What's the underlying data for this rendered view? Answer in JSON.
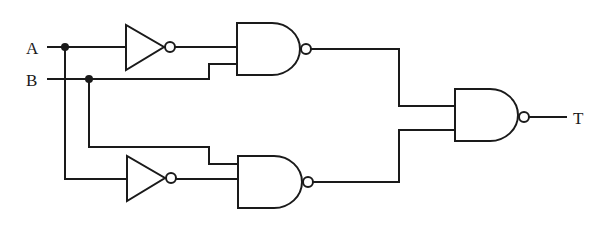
{
  "diagram": {
    "type": "logic-circuit",
    "inputs": {
      "a": "A",
      "b": "B"
    },
    "output": "T",
    "gates": [
      {
        "id": "inv1",
        "kind": "NOT",
        "input": "A"
      },
      {
        "id": "inv2",
        "kind": "NOT",
        "input": "A"
      },
      {
        "id": "nand1",
        "kind": "NAND",
        "inputs": [
          "NOT A",
          "B"
        ]
      },
      {
        "id": "nand2",
        "kind": "NAND",
        "inputs": [
          "B",
          "NOT A"
        ]
      },
      {
        "id": "nand3",
        "kind": "NAND",
        "inputs": [
          "nand1",
          "nand2"
        ],
        "output": "T"
      }
    ],
    "colors": {
      "line": "#1a1a1a",
      "background": "#ffffff"
    }
  }
}
